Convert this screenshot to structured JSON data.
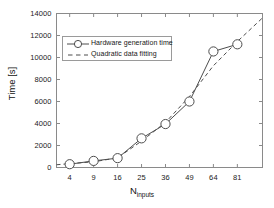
{
  "chart_data": {
    "type": "line",
    "title": "",
    "xlabel": "N_inputs",
    "xlabel_base": "N",
    "xlabel_sub": "inputs",
    "ylabel": "Time [s]",
    "grid": false,
    "legend_position": "upper-left-inside",
    "x": [
      4,
      9,
      16,
      25,
      36,
      49,
      64,
      81
    ],
    "xtick_labels": [
      "4",
      "9",
      "16",
      "25",
      "36",
      "49",
      "64",
      "81"
    ],
    "ytick_labels": [
      "0",
      "2000",
      "4000",
      "6000",
      "8000",
      "10000",
      "12000",
      "14000"
    ],
    "ytick_values": [
      0,
      2000,
      4000,
      6000,
      8000,
      10000,
      12000,
      14000
    ],
    "ylim": [
      0,
      14000
    ],
    "xlim_index": [
      -0.55,
      8.05
    ],
    "series": [
      {
        "name": "Hardware generation time",
        "marker": "circle-open",
        "linestyle": "solid",
        "color": "#4d4d4d",
        "values": [
          300,
          600,
          850,
          2650,
          3950,
          6000,
          10550,
          11200
        ]
      },
      {
        "name": "Quadratic data fitting",
        "marker": "none",
        "linestyle": "dashed",
        "color": "#4d4d4d",
        "values": [
          350,
          520,
          880,
          2400,
          4100,
          6450,
          9250,
          11450
        ],
        "extrapolated_end": 13600
      }
    ],
    "legend_entries": [
      {
        "label": "Hardware generation time",
        "sample": "circle-line"
      },
      {
        "label": "Quadratic data fitting",
        "sample": "dashed-line"
      }
    ],
    "axis_color": "#7a7a7a",
    "text_color": "#1a1a1a"
  }
}
